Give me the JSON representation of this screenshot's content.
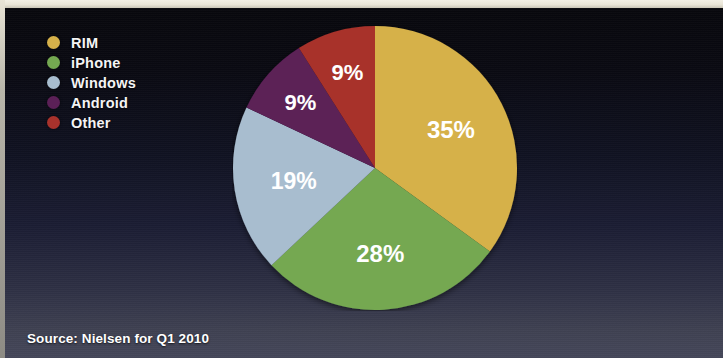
{
  "figure": {
    "background_top_color": "#08080d",
    "background_bottom_color": "#45475a",
    "paper_border_color": "#e8e4d6"
  },
  "legend": {
    "items": [
      {
        "label": "RIM",
        "color": "#d6b14a"
      },
      {
        "label": "iPhone",
        "color": "#74a851"
      },
      {
        "label": "Windows",
        "color": "#a8bdcf"
      },
      {
        "label": "Android",
        "color": "#5b2057"
      },
      {
        "label": "Other",
        "color": "#a8322c"
      }
    ]
  },
  "caption": {
    "source_text": "Source: Nielsen for Q1 2010"
  },
  "chart_data": {
    "type": "pie",
    "title": "",
    "subtitle": "",
    "legend_position": "top-left",
    "start_angle_deg": 0,
    "direction": "clockwise",
    "categories": [
      "RIM",
      "iPhone",
      "Windows",
      "Android",
      "Other"
    ],
    "values": [
      35,
      28,
      19,
      9,
      9
    ],
    "value_unit": "%",
    "labels": [
      "35%",
      "28%",
      "19%",
      "9%",
      "9%"
    ],
    "colors": [
      "#d6b14a",
      "#74a851",
      "#a8bdcf",
      "#5b2057",
      "#a8322c"
    ],
    "label_color": "#ffffff",
    "annotations": [
      "Source: Nielsen for Q1 2010"
    ]
  }
}
